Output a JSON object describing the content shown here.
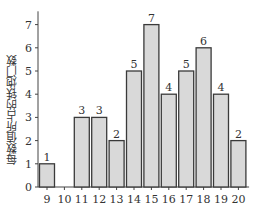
{
  "chart_data": {
    "type": "bar",
    "title": "",
    "xlabel": "",
    "ylabel": "每数值所占的铁炮门数",
    "categories": [
      "9",
      "10",
      "11",
      "12",
      "13",
      "14",
      "15",
      "16",
      "17",
      "18",
      "19",
      "20"
    ],
    "values": [
      1,
      0,
      3,
      3,
      2,
      5,
      7,
      4,
      5,
      6,
      4,
      2
    ],
    "data_labels": [
      "1",
      "",
      "3",
      "3",
      "2",
      "5",
      "7",
      "4",
      "5",
      "6",
      "4",
      "2"
    ],
    "ylim": [
      0,
      7.4
    ],
    "yticks": [
      0,
      1,
      2,
      3,
      4,
      5,
      6,
      7
    ],
    "grid": false,
    "legend": null,
    "colors": {
      "bar_fill": "#d9d9d9",
      "bar_stroke": "#3a3a3a",
      "axis": "#444444",
      "text": "#333333"
    }
  }
}
